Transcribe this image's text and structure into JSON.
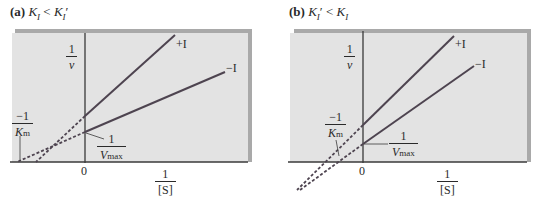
{
  "panels": [
    {
      "id": "a",
      "title_prefix": "(a)",
      "title_k1": "K",
      "title_k1_sub": "I",
      "title_op": "<",
      "title_k2": "K",
      "title_k2_sub": "I",
      "title_k2_prime": "′",
      "title_text": "(a) K_I < K_I′",
      "y_axis_label": {
        "num": "1",
        "den": "v"
      },
      "x_axis_label": {
        "num": "1",
        "den": "[S]"
      },
      "origin_label": "0",
      "km_label": {
        "num": "−1",
        "den_main": "K",
        "den_sub": "m"
      },
      "vmax_label": {
        "num": "1",
        "den_main": "V",
        "den_sub": "max"
      },
      "line_labels": {
        "plus": "+I",
        "minus": "−I"
      }
    },
    {
      "id": "b",
      "title_prefix": "(b)",
      "title_k1": "K",
      "title_k1_sub": "I",
      "title_k1_prime": "′",
      "title_op": "<",
      "title_k2": "K",
      "title_k2_sub": "I",
      "title_text": "(b) K_I′ < K_I",
      "y_axis_label": {
        "num": "1",
        "den": "v"
      },
      "x_axis_label": {
        "num": "1",
        "den": "[S]"
      },
      "origin_label": "0",
      "km_label": {
        "num": "−1",
        "den_main": "K",
        "den_sub": "m"
      },
      "vmax_label": {
        "num": "1",
        "den_main": "V",
        "den_sub": "max"
      },
      "line_labels": {
        "plus": "+I",
        "minus": "−I"
      }
    }
  ],
  "colors": {
    "panel_bg": "#e3e3e3",
    "panel_shadow": "#a9a9a9",
    "axis": "#3a3a3a",
    "line": "#4e4450"
  }
}
